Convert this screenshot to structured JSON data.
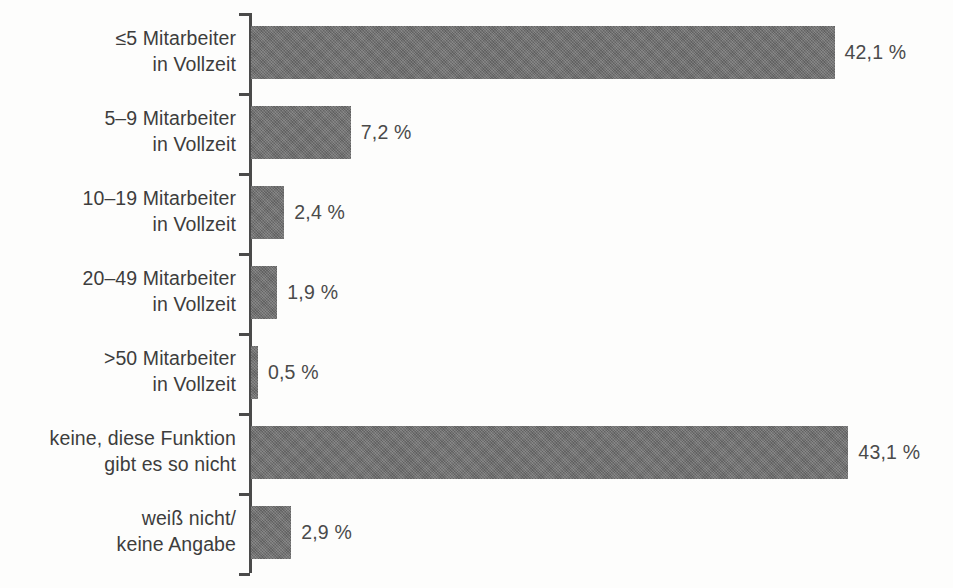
{
  "chart_data": {
    "type": "bar",
    "orientation": "horizontal",
    "title": "",
    "subtitle": "",
    "xlabel": "",
    "ylabel": "",
    "unit": "%",
    "grid": false,
    "legend": null,
    "xlim": [
      0,
      50
    ],
    "categories": [
      "≤5 Mitarbeiter in Vollzeit",
      "5–9 Mitarbeiter in Vollzeit",
      "10–19 Mitarbeiter in Vollzeit",
      "20–49 Mitarbeiter in Vollzeit",
      ">50 Mitarbeiter in Vollzeit",
      "keine, diese Funktion gibt es so nicht",
      "weiß nicht/ keine Angabe"
    ],
    "values": [
      42.1,
      7.2,
      2.4,
      1.9,
      0.5,
      43.1,
      2.9
    ],
    "value_labels": [
      "42,1 %",
      "7,2 %",
      "2,4 %",
      "1,9 %",
      "0,5 %",
      "43,1 %",
      "2,9 %"
    ],
    "colors": {
      "bar": "#6e6e6e",
      "axis": "#4a4a4a",
      "text": "#3d3d3d",
      "background": "#fdfdfc"
    }
  },
  "rows": [
    {
      "label_line1": "≤5 Mitarbeiter",
      "label_line2": "in Vollzeit",
      "value": 42.1,
      "value_label": "42,1 %"
    },
    {
      "label_line1": "5–9 Mitarbeiter",
      "label_line2": "in Vollzeit",
      "value": 7.2,
      "value_label": "7,2 %"
    },
    {
      "label_line1": "10–19 Mitarbeiter",
      "label_line2": "in Vollzeit",
      "value": 2.4,
      "value_label": "2,4 %"
    },
    {
      "label_line1": "20–49 Mitarbeiter",
      "label_line2": "in Vollzeit",
      "value": 1.9,
      "value_label": "1,9 %"
    },
    {
      "label_line1": ">50 Mitarbeiter",
      "label_line2": "in Vollzeit",
      "value": 0.5,
      "value_label": "0,5 %"
    },
    {
      "label_line1": "keine, diese Funktion",
      "label_line2": "gibt es so nicht",
      "value": 43.1,
      "value_label": "43,1 %"
    },
    {
      "label_line1": "weiß nicht/",
      "label_line2": "keine Angabe",
      "value": 2.9,
      "value_label": "2,9 %"
    }
  ]
}
